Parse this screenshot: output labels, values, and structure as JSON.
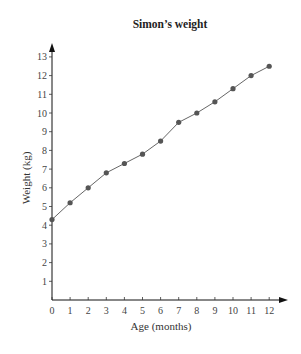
{
  "chart_data": {
    "type": "line",
    "title": "Simon’s weight",
    "xlabel": "Age (months)",
    "ylabel": "Weight (kg)",
    "x": [
      0,
      1,
      2,
      3,
      4,
      5,
      6,
      7,
      8,
      9,
      10,
      11,
      12
    ],
    "series": [
      {
        "name": "Simon’s weight",
        "values": [
          4.3,
          5.2,
          6.0,
          6.8,
          7.3,
          7.8,
          8.5,
          9.5,
          10.0,
          10.6,
          11.3,
          12.0,
          12.5
        ],
        "marker": "circle",
        "color": "#555555"
      }
    ],
    "xticks": [
      "0",
      "1",
      "2",
      "3",
      "4",
      "5",
      "6",
      "7",
      "8",
      "9",
      "10",
      "11",
      "12"
    ],
    "yticks": [
      "1",
      "2",
      "3",
      "4",
      "5",
      "6",
      "7",
      "8",
      "9",
      "10",
      "11",
      "12",
      "13"
    ],
    "xlim": [
      0,
      12
    ],
    "ylim": [
      0,
      13
    ],
    "grid": false,
    "legend": "none",
    "axes_arrows": true
  },
  "colors": {
    "axis": "#111111",
    "line": "#666666",
    "marker": "#555555",
    "text": "#333333"
  }
}
